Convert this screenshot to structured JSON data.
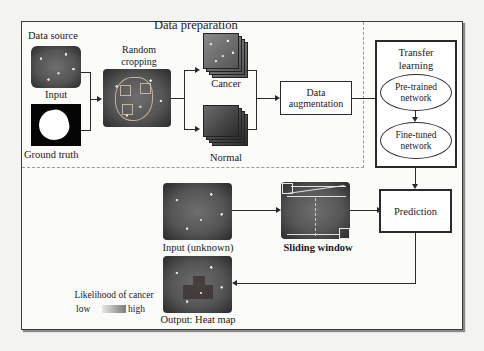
{
  "diagram": {
    "type": "flowchart",
    "sections": {
      "data_preparation": {
        "title": "Data preparation",
        "data_source": {
          "title": "Data source",
          "input_label": "Input",
          "ground_truth_label": "Ground truth"
        },
        "random_cropping_label_line1": "Random",
        "random_cropping_label_line2": "cropping",
        "cancer_label": "Cancer",
        "normal_label": "Normal",
        "augmentation_line1": "Data",
        "augmentation_line2": "augmentation"
      },
      "transfer_learning": {
        "title_line1": "Transfer",
        "title_line2": "learning",
        "pretrained_line1": "Pre-trained",
        "pretrained_line2": "network",
        "finetuned_line1": "Fine-tuned",
        "finetuned_line2": "network"
      },
      "inference": {
        "input_unknown_label": "Input (unknown)",
        "sliding_window_label": "Sliding window",
        "prediction_label": "Prediction",
        "output_label": "Output: Heat map",
        "legend": {
          "title": "Likelihood of cancer",
          "low_label": "low",
          "high_label": "high"
        }
      }
    },
    "edges": [
      [
        "Input",
        "Random cropping"
      ],
      [
        "Ground truth",
        "Random cropping"
      ],
      [
        "Random cropping",
        "Cancer"
      ],
      [
        "Random cropping",
        "Normal"
      ],
      [
        "Cancer",
        "Data augmentation"
      ],
      [
        "Normal",
        "Data augmentation"
      ],
      [
        "Data augmentation",
        "Transfer learning"
      ],
      [
        "Pre-trained network",
        "Fine-tuned network"
      ],
      [
        "Transfer learning",
        "Prediction"
      ],
      [
        "Input (unknown)",
        "Sliding window"
      ],
      [
        "Sliding window",
        "Prediction"
      ],
      [
        "Prediction",
        "Output: Heat map"
      ]
    ],
    "colors": {
      "stroke": "#2a2a2a",
      "background": "#fbfbfa",
      "dashed_divider": "#9a9a9a"
    }
  }
}
